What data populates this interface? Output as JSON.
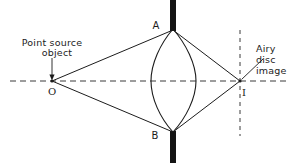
{
  "figure": {
    "type": "optics-ray-diagram",
    "background_color": "#ffffff",
    "ink_color": "#1c1c1c",
    "stop_color": "#141414"
  },
  "labels": {
    "source_line1": "Point source",
    "source_line2": "object",
    "image_line1": "Airy",
    "image_line2": "disc",
    "image_line3": "image",
    "point_o": "O",
    "point_i": "I",
    "lens_top": "A",
    "lens_bottom": "B"
  },
  "geometry": {
    "optical_axis": {
      "y": 81,
      "x_start": 10,
      "x_end": 290,
      "style": "dashed"
    },
    "object_point": {
      "x": 52,
      "y": 81,
      "label": "O"
    },
    "image_point": {
      "x": 240,
      "y": 81,
      "label": "I"
    },
    "lens": {
      "center_x": 173,
      "center_y": 81,
      "left_edge_x": 151,
      "right_edge_x": 196,
      "top_y": 29,
      "bottom_y": 133,
      "shape": "biconvex"
    },
    "aperture_stop_top": {
      "x": 173,
      "y_top": 0,
      "y_bottom": 30,
      "width": 6
    },
    "aperture_stop_bottom": {
      "x": 173,
      "y_top": 131,
      "y_bottom": 163,
      "width": 6
    },
    "image_plane": {
      "x": 240,
      "y_top": 30,
      "y_bottom": 136,
      "style": "dashed"
    },
    "rays": [
      {
        "name": "upper-ray",
        "from_x": 52,
        "from_y": 81,
        "via_x": 173,
        "via_y": 30,
        "to_x": 240,
        "to_y": 81
      },
      {
        "name": "lower-ray",
        "from_x": 52,
        "from_y": 81,
        "via_x": 173,
        "via_y": 132,
        "to_x": 240,
        "to_y": 81
      }
    ],
    "source_leader": {
      "x": 52,
      "y_top": 57,
      "y_bottom": 79,
      "arrow": true
    },
    "image_leader": {
      "x1": 262,
      "y1": 60,
      "x2": 241,
      "y2": 80
    }
  },
  "label_positions": {
    "source_line1": {
      "x": 52,
      "y": 46
    },
    "source_line2": {
      "x": 56,
      "y": 56
    },
    "image_line1": {
      "x": 256,
      "y": 51
    },
    "image_line2": {
      "x": 256,
      "y": 62
    },
    "image_line3": {
      "x": 256,
      "y": 73
    },
    "point_o": {
      "x": 49,
      "y": 94
    },
    "point_i": {
      "x": 243,
      "y": 95
    },
    "lens_top": {
      "x": 154,
      "y": 29
    },
    "lens_bottom": {
      "x": 153,
      "y": 137
    }
  }
}
